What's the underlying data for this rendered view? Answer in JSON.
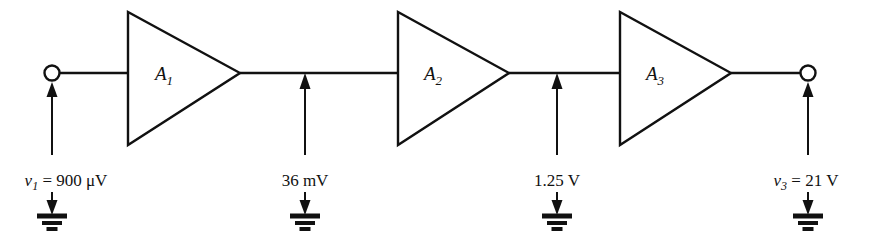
{
  "figure": {
    "type": "cascaded-amplifier-chain",
    "title": "",
    "background_color": "#ffffff",
    "line_color": "#111111"
  },
  "amplifiers": [
    {
      "id": "A1",
      "label_main": "A",
      "label_sub": "1"
    },
    {
      "id": "A2",
      "label_main": "A",
      "label_sub": "2"
    },
    {
      "id": "A3",
      "label_main": "A",
      "label_sub": "3"
    }
  ],
  "nodes": [
    {
      "id": "input",
      "terminal": "open-circle",
      "label_prefix": "v",
      "label_sub": "1",
      "label_eq": " = 900 ",
      "label_unit": "μV",
      "full_text": "v1 = 900 μV",
      "value": "900",
      "unit": "μV",
      "ground": true
    },
    {
      "id": "node2",
      "terminal": "tap",
      "label_prefix": "",
      "label_sub": "",
      "label_eq": "",
      "label_unit": "36 mV",
      "full_text": "36 mV",
      "value": "36",
      "unit": "mV",
      "ground": true
    },
    {
      "id": "node3",
      "terminal": "tap",
      "label_prefix": "",
      "label_sub": "",
      "label_eq": "",
      "label_unit": "1.25 V",
      "full_text": "1.25 V",
      "value": "1.25",
      "unit": "V",
      "ground": true
    },
    {
      "id": "output",
      "terminal": "open-circle",
      "label_prefix": "v",
      "label_sub": "3",
      "label_eq": " = 21 ",
      "label_unit": "V",
      "full_text": "v3 = 21 V",
      "value": "21",
      "unit": "V",
      "ground": true
    }
  ],
  "ground_symbol": {
    "name": "earth-ground",
    "bars": 3,
    "count": 4
  }
}
